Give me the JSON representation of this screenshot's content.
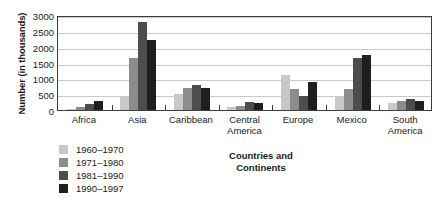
{
  "chart_data": {
    "type": "bar",
    "title": "",
    "xlabel": "Countries and Continents",
    "ylabel": "Number (in thousands)",
    "ylim": [
      0,
      3000
    ],
    "yticks": [
      0,
      500,
      1000,
      1500,
      2000,
      2500,
      3000
    ],
    "ytick_labels": [
      "0",
      "500",
      "1000",
      "1500",
      "2000",
      "2500",
      "3000"
    ],
    "grid": true,
    "legend_position": "below-left",
    "categories": [
      "Africa",
      "Asia",
      "Caribbean",
      "Central America",
      "Europe",
      "Mexico",
      "South America"
    ],
    "category_lines": [
      [
        "Africa"
      ],
      [
        "Asia"
      ],
      [
        "Caribbean"
      ],
      [
        "Central",
        "America"
      ],
      [
        "Europe"
      ],
      [
        "Mexico"
      ],
      [
        "South",
        "America"
      ]
    ],
    "series": [
      {
        "name": "1960–1970",
        "color": "#c8c8c8",
        "values": [
          40,
          400,
          500,
          100,
          1120,
          450,
          230
        ]
      },
      {
        "name": "1971–1980",
        "color": "#8c8c8c",
        "values": [
          90,
          1650,
          700,
          140,
          650,
          650,
          280
        ]
      },
      {
        "name": "1981–1990",
        "color": "#4d4d4d",
        "values": [
          190,
          2770,
          800,
          250,
          450,
          1650,
          350
        ]
      },
      {
        "name": "1990–1997",
        "color": "#1f1f1f",
        "values": [
          280,
          2200,
          700,
          220,
          900,
          1750,
          270
        ]
      }
    ]
  },
  "colors": {
    "axis": "#3c3c3c",
    "gridline": "#c9c9c9",
    "background": "#ffffff",
    "text": "#1a1a1a"
  }
}
